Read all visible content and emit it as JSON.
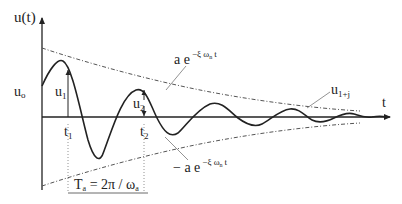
{
  "diagram": {
    "axes": {
      "y_label": "u(t)",
      "x_label": "t"
    },
    "labels": {
      "u0": "u",
      "u0_sub": "o",
      "u1": "u",
      "u1_sub": "1",
      "u2": "u",
      "u2_sub": "2",
      "u1j": "u",
      "u1j_sub": "1+j",
      "t1": "t",
      "t1_sub": "1",
      "t2": "t",
      "t2_sub": "2",
      "upper_envelope": "a e",
      "upper_envelope_exp": "−ξ ω",
      "upper_envelope_exp_sub": "n",
      "upper_envelope_exp_t": "t",
      "lower_envelope": "− a e",
      "lower_envelope_exp": "−ξ ω",
      "lower_envelope_exp_sub": "n",
      "lower_envelope_exp_t": "t",
      "period": "T",
      "period_sub": "a",
      "period_eq": " = 2π / ω",
      "period_eq_sub": "a"
    },
    "colors": {
      "curve": "#222222",
      "envelope": "#555555",
      "axis": "#222222"
    }
  }
}
